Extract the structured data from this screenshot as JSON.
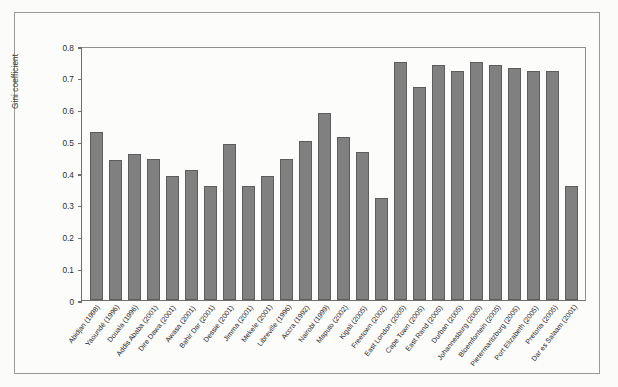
{
  "chart_data": {
    "type": "bar",
    "title": "",
    "subtitle": "",
    "xlabel": "",
    "ylabel": "Gini coefficient",
    "ylim": [
      0,
      0.8
    ],
    "yticks": [
      "0",
      "0.1",
      "0.2",
      "0.3",
      "0.4",
      "0.5",
      "0.6",
      "0.7",
      "0.8"
    ],
    "ytick_values": [
      0,
      0.1,
      0.2,
      0.3,
      0.4,
      0.5,
      0.6,
      0.7,
      0.8
    ],
    "grid": false,
    "legend": null,
    "legend_position": "none",
    "bar_color": "#808080",
    "bar_edge_color": "#5d5d5d",
    "plot_background": "#fcfcfb",
    "categories": [
      "Abidjan (1998)",
      "Yaoundé (1996)",
      "Douala (1996)",
      "Addis Ababa (2001)",
      "Dire Dawa (2001)",
      "Awasa (2001)",
      "Bahir Dar (2001)",
      "Dessie (2001)",
      "Jimma (2001)",
      "Mekele (2001)",
      "Libreville (1996)",
      "Accra (1992)",
      "Nairobi (1999)",
      "Maputo (2002)",
      "Kigali (2005)",
      "Freetown (2002)",
      "East London (2005)",
      "Cape Town (2005)",
      "East Rand (2005)",
      "Durban (2005)",
      "Johannesburg (2005)",
      "Bloemfontein (2005)",
      "Pietermaritzburg (2005)",
      "Port Elizabeth (2005)",
      "Pretoria (2005)",
      "Dar es Salaam (2001)"
    ],
    "values": [
      0.53,
      0.44,
      0.46,
      0.445,
      0.39,
      0.41,
      0.36,
      0.49,
      0.36,
      0.39,
      0.445,
      0.5,
      0.59,
      0.515,
      0.465,
      0.32,
      0.75,
      0.67,
      0.74,
      0.72,
      0.75,
      0.74,
      0.73,
      0.72,
      0.72,
      0.36
    ]
  }
}
